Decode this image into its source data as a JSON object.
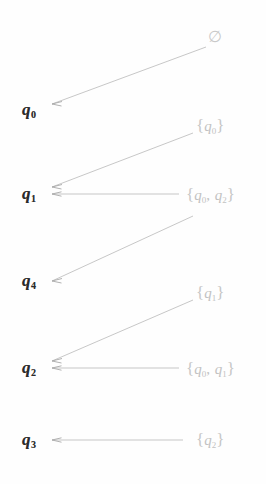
{
  "figure": {
    "colors": {
      "state_text": "#2b2b2b",
      "set_text": "#c2c2c2",
      "arrow": "#b9b9b9",
      "background": "#ffffff"
    },
    "states": [
      {
        "name": "q0",
        "base": "q",
        "sub": "0"
      },
      {
        "name": "q1",
        "base": "q",
        "sub": "1"
      },
      {
        "name": "q4",
        "base": "q",
        "sub": "4"
      },
      {
        "name": "q2",
        "base": "q",
        "sub": "2"
      },
      {
        "name": "q3",
        "base": "q",
        "sub": "3"
      }
    ],
    "sets": [
      {
        "name": "empty-set",
        "text": "∅",
        "open": "",
        "items": [],
        "close": ""
      },
      {
        "name": "set-q0",
        "open": "{",
        "items": [
          {
            "base": "q",
            "sub": "0"
          }
        ],
        "close": "}",
        "separator": ","
      },
      {
        "name": "set-q0-q2",
        "open": "{",
        "items": [
          {
            "base": "q",
            "sub": "0"
          },
          {
            "base": "q",
            "sub": "2"
          }
        ],
        "close": "}",
        "separator": ","
      },
      {
        "name": "set-q1",
        "open": "{",
        "items": [
          {
            "base": "q",
            "sub": "1"
          }
        ],
        "close": "}",
        "separator": ","
      },
      {
        "name": "set-q0-q1",
        "open": "{",
        "items": [
          {
            "base": "q",
            "sub": "0"
          },
          {
            "base": "q",
            "sub": "1"
          }
        ],
        "close": "}",
        "separator": ","
      },
      {
        "name": "set-q2",
        "open": "{",
        "items": [
          {
            "base": "q",
            "sub": "2"
          }
        ],
        "close": "}",
        "separator": ","
      }
    ],
    "mappings": [
      {
        "from": "∅",
        "to": "q0"
      },
      {
        "from": "{q0}",
        "to": "q1"
      },
      {
        "from": "{q0, q2}",
        "to": "q1"
      },
      {
        "from": "{q1}",
        "to": "q2"
      },
      {
        "from": "{q0, q1}",
        "to": "q2"
      },
      {
        "from": "{q2}",
        "to": "q3"
      },
      {
        "from": "{q0, q2}",
        "to": "q4"
      }
    ]
  }
}
